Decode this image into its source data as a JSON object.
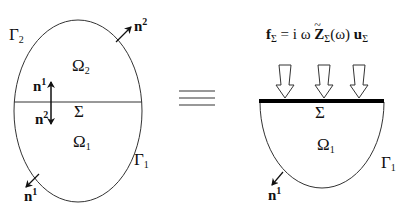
{
  "left_figure": {
    "boundary_top": {
      "symbol": "Γ",
      "sub": "2"
    },
    "boundary_bottom": {
      "symbol": "Γ",
      "sub": "1"
    },
    "domain_top": {
      "symbol": "Ω",
      "sub": "2"
    },
    "domain_bottom": {
      "symbol": "Ω",
      "sub": "1"
    },
    "interface": "Σ",
    "normals": [
      {
        "symbol": "n",
        "sup": "2",
        "position": "outer-top-right"
      },
      {
        "symbol": "n",
        "sup": "1",
        "position": "interface-up"
      },
      {
        "symbol": "n",
        "sup": "2",
        "position": "interface-down"
      },
      {
        "symbol": "n",
        "sup": "1",
        "position": "outer-bottom-left"
      }
    ]
  },
  "equivalence_symbol": "≡",
  "right_figure": {
    "equation": {
      "lhs": "f",
      "lhs_sub": "Σ",
      "eq": "=",
      "i_omega": "i ω",
      "Z": "Z",
      "Z_sub": "Σ",
      "omega_arg": "(ω)",
      "u": "u",
      "u_sub": "Σ"
    },
    "interface": "Σ",
    "domain": {
      "symbol": "Ω",
      "sub": "1"
    },
    "boundary": {
      "symbol": "Γ",
      "sub": "1"
    },
    "normal": {
      "symbol": "n",
      "sup": "1"
    },
    "load_arrows": 3
  },
  "colors": {
    "stroke": "#222222",
    "background": "#ffffff"
  }
}
